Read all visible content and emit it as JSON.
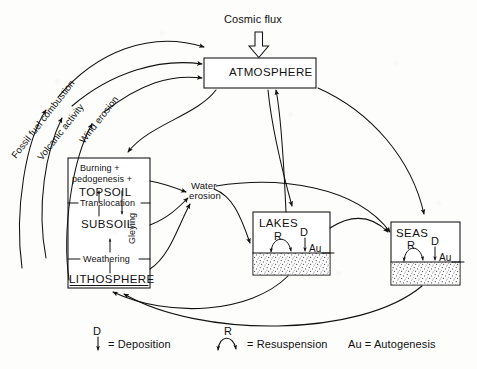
{
  "diagram": {
    "background_color": "#fdfdfc",
    "ink_color": "#111111"
  },
  "boxes": {
    "atmosphere": {
      "label": "ATMOSPHERE"
    },
    "soil": {
      "line1": "Burning +",
      "line2": "pedogenesis +",
      "topsoil": "TOPSOIL",
      "translocation": "Translocation",
      "gleying": "Gleying",
      "subsoil": "SUBSOIL",
      "weathering": "Weathering",
      "lithosphere": "LITHOSPHERE"
    },
    "lakes": {
      "label": "LAKES",
      "resuspension_symbol": "R",
      "deposition_symbol": "D",
      "autogenesis_symbol": "Au"
    },
    "seas": {
      "label": "SEAS",
      "resuspension_symbol": "R",
      "deposition_symbol": "D",
      "autogenesis_symbol": "Au"
    }
  },
  "flux_labels": {
    "cosmic_flux": "Cosmic flux",
    "fossil_fuel_combustion": "Fossil fuel combustion",
    "volcanic_activity": "Volcanic activity",
    "wind_erosion": "Wind erosion",
    "water_erosion_line1": "Water",
    "water_erosion_line2": "erosion"
  },
  "legend": {
    "deposition_symbol": "D",
    "deposition_text": "= Deposition",
    "resuspension_symbol": "R",
    "resuspension_text": "= Resuspension",
    "autogenesis_text": "Au = Autogenesis"
  }
}
